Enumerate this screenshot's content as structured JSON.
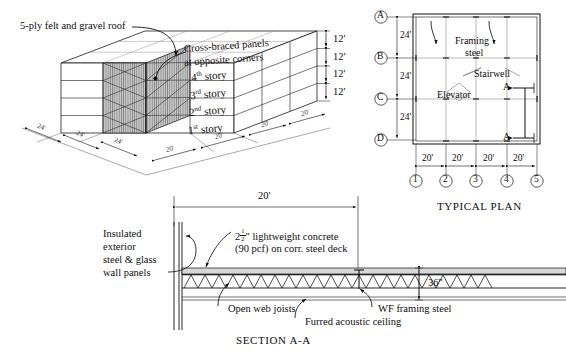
{
  "figure": {
    "isometric": {
      "callouts": [
        {
          "id": "roof",
          "text": "5-ply felt and gravel roof"
        },
        {
          "id": "bracing_line1",
          "text": "Cross-braced panels"
        },
        {
          "id": "bracing_line2",
          "text": "at opposite corners"
        }
      ],
      "story_labels": [
        {
          "ordinal": "4",
          "suffix": "th",
          "word": "story"
        },
        {
          "ordinal": "3",
          "suffix": "rd",
          "word": "story"
        },
        {
          "ordinal": "2",
          "suffix": "nd",
          "word": "story"
        },
        {
          "ordinal": "1",
          "suffix": "st",
          "word": "story"
        }
      ],
      "story_heights": [
        "12'",
        "12'",
        "12'",
        "12'"
      ],
      "bay_dims_front": [
        "20'",
        "20'",
        "20'",
        "20'"
      ],
      "bay_dims_side": [
        "24'",
        "24'",
        "24'"
      ]
    },
    "plan": {
      "title": "TYPICAL PLAN",
      "row_grid_labels": [
        "A",
        "B",
        "C",
        "D"
      ],
      "col_grid_labels": [
        "1",
        "2",
        "3",
        "4",
        "5"
      ],
      "row_dims": [
        "24'",
        "24'",
        "24'"
      ],
      "col_dims": [
        "20'",
        "20'",
        "20'",
        "20'"
      ],
      "annotations": [
        {
          "id": "framing-steel",
          "line1": "Framing",
          "line2": "steel"
        },
        {
          "id": "stairwell",
          "text": "Stairwell"
        },
        {
          "id": "elevator",
          "text": "Elevator"
        }
      ],
      "section_marks": [
        "A",
        "A"
      ]
    },
    "section": {
      "title": "SECTION A-A",
      "span_dim": "20'",
      "depth_dim": "36\"",
      "labels": [
        {
          "id": "wall-panels",
          "lines": [
            "Insulated",
            "exterior",
            "steel & glass",
            "wall panels"
          ]
        },
        {
          "id": "concrete-deck",
          "line1_pre": "2",
          "line1_frac_num": "1",
          "line1_frac_den": "2",
          "line1_post": "\" lightweight concrete",
          "line2": "(90 pcf) on corr. steel deck"
        },
        {
          "id": "open-web-joists",
          "text": "Open web joists"
        },
        {
          "id": "furred-ceiling",
          "text": "Furred acoustic ceiling"
        },
        {
          "id": "wf-framing-steel",
          "text": "WF framing steel"
        }
      ]
    }
  },
  "colors": {
    "ink": "#111111",
    "line": "#1a1a1a",
    "thin": "#555555",
    "hatch": "#9a9a9a",
    "concrete": "#d8d8d8"
  }
}
